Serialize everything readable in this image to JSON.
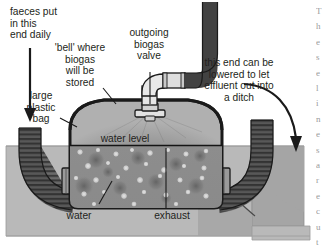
{
  "diagram": {
    "labels": [
      {
        "id": "faeces-input",
        "text": "faeces put\nin this\nend daily",
        "x": 10,
        "y": 6,
        "align": "left"
      },
      {
        "id": "bell-gas-store",
        "text": "'bell' where\nbiogas\nwill be\nstored",
        "x": 78,
        "y": 42,
        "align": "center"
      },
      {
        "id": "outgoing-valve",
        "text": "outgoing\nbiogas\nvalve",
        "x": 148,
        "y": 27,
        "align": "center"
      },
      {
        "id": "large-plastic-bag",
        "text": "large\nplastic\nbag",
        "x": 40,
        "y": 90,
        "align": "center"
      },
      {
        "id": "effluent-outlet",
        "text": "this end can be\nlowered to let\neffluent out into\na ditch",
        "x": 216,
        "y": 57,
        "align": "center"
      },
      {
        "id": "water-level",
        "text": "water level",
        "x": 125,
        "y": 140,
        "align": "center"
      },
      {
        "id": "water",
        "text": "water",
        "x": 78,
        "y": 216,
        "align": "center"
      },
      {
        "id": "exhaust",
        "text": "exhaust",
        "x": 170,
        "y": 216,
        "align": "center"
      }
    ],
    "edge_column_fragments": [
      "T",
      "h",
      "e",
      "s",
      "e",
      "l",
      "i",
      "n",
      "e",
      "s",
      "a",
      "r",
      "e",
      "c",
      "u",
      "t",
      "o",
      "f",
      "f"
    ],
    "colors": {
      "ground": "#b9b9b9",
      "ground_dark": "#a3a3a3",
      "slurry": "#8f8f8f",
      "gas_bell": "#989898",
      "pipe_dark": "#4e4e4e",
      "pipe_light": "#d8d8d8",
      "outline": "#1a1a1a",
      "text": "#231f20",
      "bubble": "#d9d9d9"
    }
  }
}
